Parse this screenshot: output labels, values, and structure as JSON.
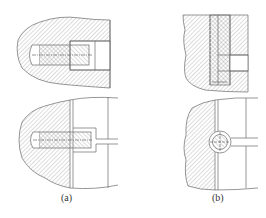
{
  "figure": {
    "type": "engineering-section-drawing",
    "panels": [
      {
        "id": "a",
        "label": "(a)",
        "views": [
          "top: counterbored screw in hatched housing (section)",
          "bottom: screw head seated against mating part with slot"
        ]
      },
      {
        "id": "b",
        "label": "(b)",
        "views": [
          "top: vertical pin/screw through hatched block with side hole",
          "bottom: round pin in circular recess at joint line"
        ]
      }
    ],
    "colors": {
      "line": "#6a6a6a",
      "hatch": "#8a8a8a",
      "background": "#ffffff"
    }
  }
}
